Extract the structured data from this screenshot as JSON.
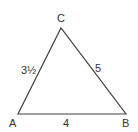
{
  "diagram": {
    "type": "triangle",
    "stroke_color": "#444444",
    "text_color": "#333333",
    "vertices": {
      "A": {
        "label": "A",
        "x": 18,
        "y": 114
      },
      "B": {
        "label": "B",
        "x": 126,
        "y": 114
      },
      "C": {
        "label": "C",
        "x": 61,
        "y": 28
      }
    },
    "sides": {
      "AB": {
        "label": "4"
      },
      "BC": {
        "label": "5"
      },
      "AC": {
        "label": "3½"
      }
    }
  }
}
